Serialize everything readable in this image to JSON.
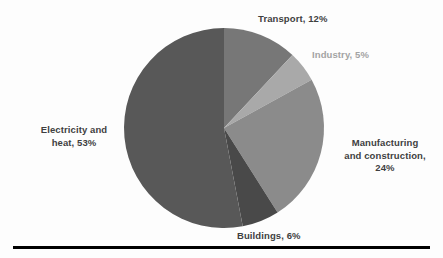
{
  "chart_data": {
    "type": "pie",
    "title": "",
    "subtitle": "",
    "xlabel": "",
    "ylabel": "",
    "grid": false,
    "legend_position": "none",
    "label_format": "name, percent",
    "start_angle_deg": 0,
    "direction": "clockwise",
    "center": {
      "x": 224,
      "y": 128,
      "radius": 100
    },
    "categories": [
      "Transport",
      "Industry",
      "Manufacturing and construction",
      "Buildings",
      "Electricity and heat"
    ],
    "values": [
      12,
      5,
      24,
      6,
      53
    ],
    "unit": "%",
    "slices": [
      {
        "name": "Transport",
        "value": 12,
        "percent_label": "12%",
        "color": "#777777",
        "label_lines": [
          "Transport, 12%"
        ],
        "label_color": "#3f3f3f",
        "label_bold": true
      },
      {
        "name": "Industry",
        "value": 5,
        "percent_label": "5%",
        "color": "#a9a9a9",
        "label_lines": [
          "Industry, 5%"
        ],
        "label_color": "#a3a3a3",
        "label_bold": true
      },
      {
        "name": "Manufacturing and construction",
        "value": 24,
        "percent_label": "24%",
        "color": "#8b8b8b",
        "label_lines": [
          "Manufacturing",
          "and construction,",
          "24%"
        ],
        "label_color": "#3f3f3f",
        "label_bold": true
      },
      {
        "name": "Buildings",
        "value": 6,
        "percent_label": "6%",
        "color": "#494949",
        "label_lines": [
          "Buildings, 6%"
        ],
        "label_color": "#3f3f3f",
        "label_bold": true
      },
      {
        "name": "Electricity and heat",
        "value": 53,
        "percent_label": "53%",
        "color": "#585858",
        "label_lines": [
          "Electricity and",
          "heat, 53%"
        ],
        "label_color": "#3f3f3f",
        "label_bold": true
      }
    ]
  },
  "labels": {
    "transport": "Transport,  12%",
    "industry": "Industry, 5%",
    "manufacturing_line1": "Manufacturing",
    "manufacturing_line2": "and construction,",
    "manufacturing_line3": "24%",
    "electricity_line1": "Electricity and",
    "electricity_line2": "heat, 53%",
    "buildings": "Buildings, 6%"
  },
  "colors": {
    "background": "#fdfdfd",
    "transport": "#777777",
    "industry": "#a9a9a9",
    "manufacturing": "#8b8b8b",
    "buildings": "#494949",
    "electricity": "#585858",
    "rule": "#000000",
    "label_dark": "#3f3f3f",
    "label_light": "#a3a3a3"
  }
}
